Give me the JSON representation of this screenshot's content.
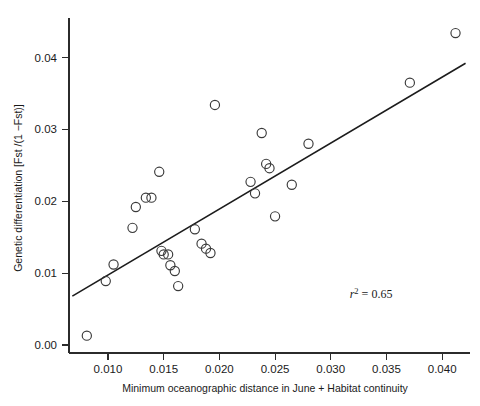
{
  "chart_data": {
    "type": "scatter",
    "title": "",
    "xlabel": "Minimum oceanographic distance in June + Habitat continuity",
    "ylabel": "Genetic differentiation [Fst /(1 −Fst)]",
    "xlim": [
      0.0065,
      0.0425
    ],
    "ylim": [
      0.0,
      0.0455
    ],
    "grid": false,
    "legend": null,
    "xticks": [
      0.01,
      0.015,
      0.02,
      0.025,
      0.03,
      0.035,
      0.04
    ],
    "xtick_labels": [
      "0.010",
      "0.015",
      "0.020",
      "0.025",
      "0.030",
      "0.035",
      "0.040"
    ],
    "yticks": [
      0.0,
      0.01,
      0.02,
      0.03,
      0.04
    ],
    "ytick_labels": [
      "0.00",
      "0.01",
      "0.02",
      "0.03",
      "0.04"
    ],
    "marker": "open-circle",
    "marker_radius_px": 4.6,
    "points": [
      {
        "x": 0.0081,
        "y": 0.0013
      },
      {
        "x": 0.0098,
        "y": 0.0089
      },
      {
        "x": 0.0105,
        "y": 0.0112
      },
      {
        "x": 0.0122,
        "y": 0.0163
      },
      {
        "x": 0.0125,
        "y": 0.0192
      },
      {
        "x": 0.0134,
        "y": 0.0205
      },
      {
        "x": 0.0139,
        "y": 0.0205
      },
      {
        "x": 0.0146,
        "y": 0.0241
      },
      {
        "x": 0.0148,
        "y": 0.0131
      },
      {
        "x": 0.015,
        "y": 0.0126
      },
      {
        "x": 0.0154,
        "y": 0.0126
      },
      {
        "x": 0.0156,
        "y": 0.0111
      },
      {
        "x": 0.016,
        "y": 0.0103
      },
      {
        "x": 0.0163,
        "y": 0.0082
      },
      {
        "x": 0.0178,
        "y": 0.0161
      },
      {
        "x": 0.0184,
        "y": 0.0141
      },
      {
        "x": 0.0188,
        "y": 0.0134
      },
      {
        "x": 0.0192,
        "y": 0.0128
      },
      {
        "x": 0.0196,
        "y": 0.0334
      },
      {
        "x": 0.0228,
        "y": 0.0227
      },
      {
        "x": 0.0232,
        "y": 0.0211
      },
      {
        "x": 0.0238,
        "y": 0.0295
      },
      {
        "x": 0.0242,
        "y": 0.0252
      },
      {
        "x": 0.0245,
        "y": 0.0246
      },
      {
        "x": 0.025,
        "y": 0.0179
      },
      {
        "x": 0.0265,
        "y": 0.0223
      },
      {
        "x": 0.028,
        "y": 0.028
      },
      {
        "x": 0.0371,
        "y": 0.0365
      },
      {
        "x": 0.0412,
        "y": 0.0434
      }
    ],
    "fit_line": {
      "x_start": 0.0068,
      "y_start": 0.0068,
      "x_end": 0.0421,
      "y_end": 0.0392
    },
    "annotation": {
      "symbol": "r",
      "exponent": "2",
      "equals": " = ",
      "value": "0.65",
      "x": 0.0317,
      "y": 0.0066
    }
  },
  "axes": {
    "x_axis_name": "x-axis",
    "y_axis_name": "y-axis"
  }
}
